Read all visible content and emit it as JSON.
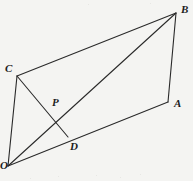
{
  "figure": {
    "kind": "geometry-diagram",
    "background_color": "#f4f4f2",
    "stroke_color": "#2a2a2a",
    "stroke_width": 1.1,
    "label_color": "#1c1c1c",
    "width": 193,
    "height": 181,
    "points": [
      {
        "id": "O",
        "label": "O",
        "x": 8,
        "y": 166,
        "label_x": 0,
        "label_y": 160,
        "label_anchor": "start"
      },
      {
        "id": "C",
        "label": "C",
        "x": 17,
        "y": 76,
        "label_x": 5,
        "label_y": 63,
        "label_anchor": "start"
      },
      {
        "id": "B",
        "label": "B",
        "x": 176,
        "y": 13,
        "label_x": 181,
        "label_y": 4,
        "label_anchor": "start"
      },
      {
        "id": "A",
        "label": "A",
        "x": 168,
        "y": 102,
        "label_x": 174,
        "label_y": 98,
        "label_anchor": "start"
      },
      {
        "id": "D",
        "label": "D",
        "x": 68,
        "y": 137,
        "label_x": 70,
        "label_y": 141,
        "label_anchor": "start"
      },
      {
        "id": "P",
        "label": "P",
        "x": 57,
        "y": 116,
        "label_x": 52,
        "label_y": 97,
        "label_anchor": "start"
      }
    ],
    "segments": [
      {
        "name": "side-C-B",
        "from": "C",
        "to": "B"
      },
      {
        "name": "side-B-A",
        "from": "B",
        "to": "A"
      },
      {
        "name": "side-A-O",
        "from": "A",
        "to": "O"
      },
      {
        "name": "side-O-C",
        "from": "O",
        "to": "C"
      },
      {
        "name": "diagonal-O-B",
        "from": "O",
        "to": "B"
      },
      {
        "name": "cevian-C-D",
        "from": "C",
        "to": "D"
      }
    ],
    "intersection": {
      "name": "P",
      "of": [
        "diagonal-O-B",
        "cevian-C-D"
      ],
      "x": 57,
      "y": 116
    },
    "specks": [
      {
        "x": 88,
        "y": 4,
        "size": 1.4
      },
      {
        "x": 150,
        "y": 3,
        "size": 1.1
      },
      {
        "x": 58,
        "y": 176,
        "size": 1.2
      },
      {
        "x": 96,
        "y": 175,
        "size": 1.3
      },
      {
        "x": 120,
        "y": 177,
        "size": 1.1
      },
      {
        "x": 140,
        "y": 174,
        "size": 1.2
      },
      {
        "x": 30,
        "y": 178,
        "size": 1.0
      }
    ]
  }
}
